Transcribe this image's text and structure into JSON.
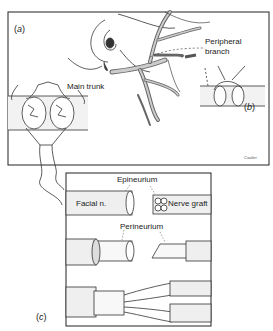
{
  "figure": {
    "panels": [
      {
        "id": "a",
        "tag_open": "(",
        "tag_letter": "a",
        "tag_close": ")"
      },
      {
        "id": "b",
        "tag_open": "(",
        "tag_letter": "b",
        "tag_close": ")"
      },
      {
        "id": "c",
        "tag_open": "(",
        "tag_letter": "c",
        "tag_close": ")"
      }
    ],
    "labels": {
      "main_trunk": "Main trunk",
      "peripheral_branch_line1": "Peripheral",
      "peripheral_branch_line2": "branch",
      "epineurium": "Epineurium",
      "facial_n": "Facial n.",
      "nerve_graft": "Nerve graft",
      "perineurium": "Perineurium"
    },
    "signature": "Coulter"
  }
}
